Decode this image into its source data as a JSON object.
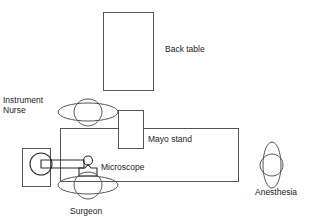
{
  "diagram": {
    "background_color": "#ffffff",
    "line_color": "#555555",
    "text_color": "#1a1a1a",
    "labels": {
      "back_table": "Back table",
      "mayo_stand": "Mayo stand",
      "microscope": "Microscope",
      "instrument_nurse_line1": "Instrument",
      "instrument_nurse_line2": "Nurse",
      "surgeon": "Surgeon",
      "anesthesia": "Anesthesia"
    },
    "objects": [
      {
        "name": "back-table",
        "type": "rectangle",
        "x": 103,
        "y": 12,
        "width": 50,
        "height": 78
      },
      {
        "name": "operating-table",
        "type": "rectangle",
        "x": 60,
        "y": 128,
        "width": 178,
        "height": 53
      },
      {
        "name": "mayo-stand",
        "type": "rectangle",
        "x": 118,
        "y": 110,
        "width": 26,
        "height": 38
      },
      {
        "name": "microscope-base",
        "type": "rectangle",
        "x": 22,
        "y": 148,
        "width": 28,
        "height": 38
      },
      {
        "name": "microscope-body",
        "type": "circle",
        "cx": 41,
        "cy": 164,
        "r": 11
      },
      {
        "name": "microscope-arm",
        "type": "arm",
        "x1": 50,
        "y1": 164,
        "x2": 87,
        "y2": 164
      },
      {
        "name": "microscope-head",
        "type": "circle",
        "cx": 88,
        "cy": 161,
        "r": 4
      },
      {
        "name": "microscope-eyepiece",
        "type": "bracket",
        "x": 79,
        "y": 168,
        "width": 18,
        "height": 9
      },
      {
        "name": "instrument-nurse-person",
        "type": "person",
        "orientation": "horizontal",
        "cx": 88,
        "cy": 112
      },
      {
        "name": "surgeon-person",
        "type": "person",
        "orientation": "horizontal",
        "cx": 88,
        "cy": 185
      },
      {
        "name": "anesthesia-person",
        "type": "person",
        "orientation": "vertical",
        "cx": 272,
        "cy": 165
      }
    ]
  }
}
